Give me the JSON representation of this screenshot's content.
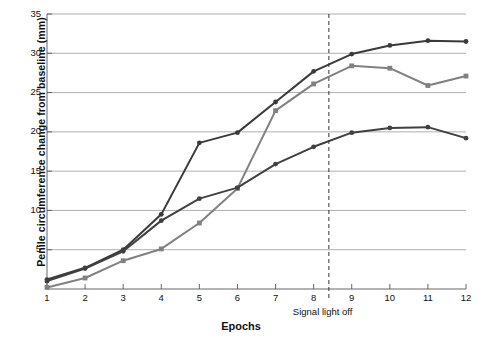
{
  "chart_data": {
    "type": "line",
    "title": "",
    "xlabel": "Epochs",
    "ylabel": "Penile circumference change from baseline (mm)",
    "x": [
      1,
      2,
      3,
      4,
      5,
      6,
      7,
      8,
      9,
      10,
      11,
      12
    ],
    "xlim": [
      1,
      12
    ],
    "ylim": [
      0,
      35
    ],
    "yticks": [
      0,
      5,
      10,
      15,
      20,
      25,
      30,
      35
    ],
    "xticks": [
      1,
      2,
      3,
      4,
      5,
      6,
      7,
      8,
      9,
      10,
      11,
      12
    ],
    "grid": "horizontal",
    "legend": "none",
    "series": [
      {
        "name": "series-dark-upper",
        "color": "#3a3a3a",
        "marker": "circle",
        "values": [
          1.2,
          2.7,
          5.0,
          9.5,
          18.6,
          19.9,
          23.8,
          27.7,
          29.9,
          31.0,
          31.6,
          31.5
        ]
      },
      {
        "name": "series-gray",
        "color": "#808080",
        "marker": "square",
        "values": [
          0.2,
          1.4,
          3.6,
          5.1,
          8.4,
          12.8,
          22.7,
          26.1,
          28.4,
          28.1,
          25.9,
          27.1
        ]
      },
      {
        "name": "series-dark-lower",
        "color": "#404040",
        "marker": "circle",
        "values": [
          1.0,
          2.6,
          4.8,
          8.7,
          11.5,
          12.9,
          15.9,
          18.1,
          19.9,
          20.5,
          20.6,
          19.2
        ]
      }
    ],
    "annotations": [
      {
        "name": "signal-light-off",
        "label": "Signal light off",
        "x": 8.4,
        "style": "dashed-vertical-line",
        "color": "#333333"
      }
    ]
  }
}
